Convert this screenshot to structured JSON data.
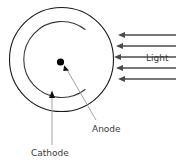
{
  "figure": {
    "type": "phototube-photocell-schematic",
    "title": "",
    "labels": {
      "light": "Light",
      "anode": "Anode",
      "cathode": "Cathode"
    },
    "colors": {
      "envelope_stroke": "#1a1a1a",
      "cathode_stroke": "#3a3a3a",
      "anode_fill": "#000000",
      "arrow_stroke": "#4a4a4a",
      "leader_stroke": "#8c8c8c",
      "text": "#3b3b3b",
      "background": "#ffffff"
    },
    "geometry": {
      "envelope_circle": {
        "cx": 61.5,
        "cy": 59.5,
        "r": 52
      },
      "cathode_arc": {
        "cx": 61.5,
        "cy": 59.5,
        "r": 38,
        "start_deg": -52,
        "end_deg": 52,
        "opening": "right"
      },
      "anode_point": {
        "cx": 60.5,
        "cy": 62.0,
        "r": 3.6
      }
    },
    "light_rays": {
      "count": 5,
      "direction": "leftward",
      "x_start": 176,
      "x_end_values": [
        118,
        116,
        114,
        116,
        118
      ],
      "y_values": [
        35,
        46,
        57,
        68,
        79
      ]
    },
    "leaders": [
      {
        "name": "anode-leader",
        "from_x": 96,
        "from_y": 120,
        "to_x": 64,
        "to_y": 66,
        "arrowhead": true
      },
      {
        "name": "cathode-leader",
        "from_x": 52,
        "from_y": 145,
        "to_x": 52,
        "to_y": 93,
        "arrowhead": true
      }
    ]
  }
}
